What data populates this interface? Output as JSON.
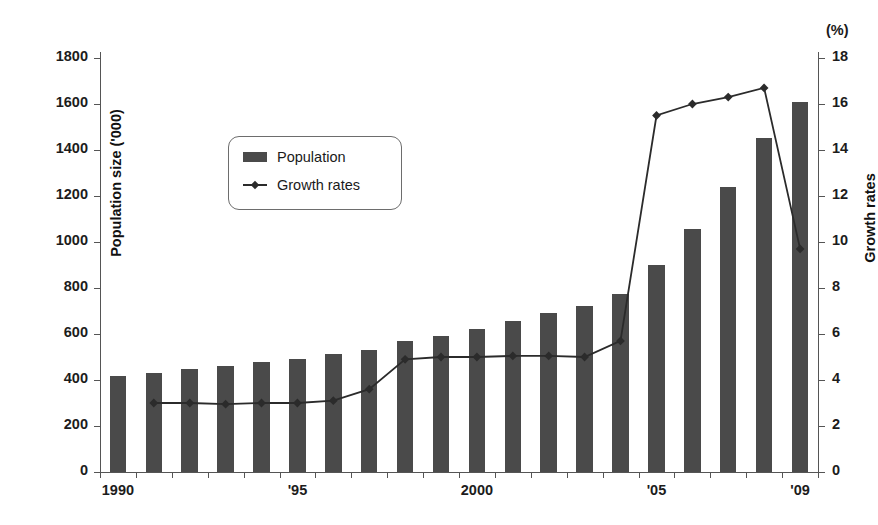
{
  "chart_data": {
    "type": "bar",
    "title": "",
    "xlabel": "",
    "ylabel": "Population size ('000)",
    "y2label": "Growth rates",
    "y2unit": "(%)",
    "categories": [
      "1990",
      "1991",
      "1992",
      "1993",
      "1994",
      "1995",
      "1996",
      "1997",
      "1998",
      "1999",
      "2000",
      "2001",
      "2002",
      "2003",
      "2004",
      "2005",
      "2006",
      "2007",
      "2008",
      "2009"
    ],
    "xtick_labels": [
      "1990",
      "'95",
      "2000",
      "'05",
      "'09"
    ],
    "xtick_indices": [
      0,
      5,
      10,
      15,
      19
    ],
    "ytick_labels": [
      "0",
      "200",
      "400",
      "600",
      "800",
      "1000",
      "1200",
      "1400",
      "1600",
      "1800"
    ],
    "ytick_values": [
      0,
      200,
      400,
      600,
      800,
      1000,
      1200,
      1400,
      1600,
      1800
    ],
    "y2tick_labels": [
      "0",
      "2",
      "4",
      "6",
      "8",
      "10",
      "12",
      "14",
      "16",
      "18"
    ],
    "y2tick_values": [
      0,
      2,
      4,
      6,
      8,
      10,
      12,
      14,
      16,
      18
    ],
    "ylim": [
      0,
      1800
    ],
    "y2lim": [
      0,
      18
    ],
    "grid": false,
    "legend_position": "upper-left-inside",
    "series": [
      {
        "name": "Population",
        "type": "bar",
        "axis": "left",
        "color": "#4a4a4a",
        "values": [
          418,
          432,
          450,
          462,
          478,
          492,
          512,
          532,
          568,
          592,
          620,
          655,
          690,
          722,
          772,
          900,
          1055,
          1238,
          1452,
          1610
        ]
      },
      {
        "name": "Growth rates",
        "type": "line",
        "axis": "right",
        "color": "#2b2b2b",
        "marker": "diamond",
        "values": [
          null,
          3.0,
          3.0,
          2.95,
          3.0,
          3.0,
          3.1,
          3.6,
          4.9,
          5.0,
          5.0,
          5.05,
          5.05,
          5.0,
          5.7,
          15.5,
          16.0,
          16.3,
          16.7,
          9.7
        ]
      }
    ]
  },
  "legend": {
    "items": [
      {
        "label": "Population",
        "icon": "bar-swatch"
      },
      {
        "label": "Growth rates",
        "icon": "line-diamond"
      }
    ]
  }
}
